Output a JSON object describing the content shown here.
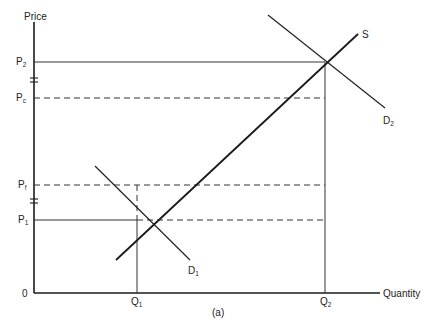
{
  "diagram": {
    "caption": "(a)",
    "axes": {
      "y_label": "Price",
      "x_label": "Quantity",
      "origin_label": "0"
    },
    "price_levels": [
      {
        "id": "P2",
        "main": "P",
        "sub": "2",
        "style": "solid"
      },
      {
        "id": "Pc",
        "main": "P",
        "sub": "c",
        "style": "dashed"
      },
      {
        "id": "Pf",
        "main": "P",
        "sub": "f",
        "style": "dashed"
      },
      {
        "id": "P1",
        "main": "P",
        "sub": "1",
        "style": "solid"
      }
    ],
    "quantity_levels": [
      {
        "id": "Q1",
        "main": "Q",
        "sub": "1"
      },
      {
        "id": "Q2",
        "main": "Q",
        "sub": "2"
      }
    ],
    "curves": [
      {
        "id": "S",
        "label": "S",
        "type": "supply"
      },
      {
        "id": "D1",
        "main": "D",
        "sub": "1",
        "type": "demand"
      },
      {
        "id": "D2",
        "main": "D",
        "sub": "2",
        "type": "demand"
      }
    ],
    "axis_breaks": [
      "between P2 and Pc",
      "between Pf and P1"
    ]
  }
}
